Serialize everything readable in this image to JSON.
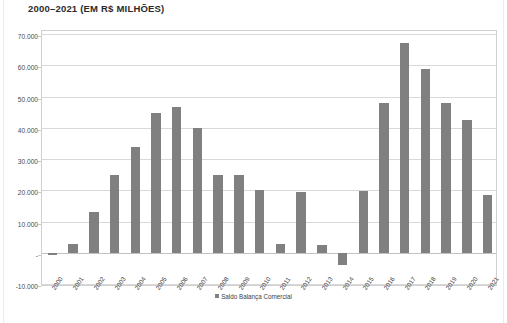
{
  "chart_data": {
    "type": "bar",
    "title": "2000–2021 (EM R$ MILHÕES)",
    "xlabel": "",
    "ylabel": "",
    "ylim": [
      -10000,
      70000
    ],
    "ytick_step": 10000,
    "ytick_labels": [
      "70.000",
      "60.000",
      "50.000",
      "40.000",
      "30.000",
      "20.000",
      "10.000",
      "-",
      "-10.000"
    ],
    "ytick_values": [
      70000,
      60000,
      50000,
      40000,
      30000,
      20000,
      10000,
      0,
      -10000
    ],
    "grid": true,
    "legend_position": "bottom",
    "bar_color": "#808080",
    "categories": [
      "2000",
      "2001",
      "2002",
      "2003",
      "2004",
      "2005",
      "2006",
      "2007",
      "2008",
      "2009",
      "2010",
      "2011",
      "2012",
      "2013",
      "2014",
      "2015",
      "2016",
      "2017",
      "2018",
      "2019",
      "2020",
      "2021"
    ],
    "series": [
      {
        "name": "Saldo Balança Comercial",
        "values": [
          -700,
          2700,
          13200,
          24900,
          33900,
          44700,
          46500,
          40000,
          24800,
          25000,
          20200,
          2900,
          19400,
          2400,
          -4000,
          19700,
          47800,
          67000,
          58700,
          48000,
          42400,
          18500
        ]
      }
    ]
  },
  "legend": {
    "entries": [
      {
        "label": "Saldo Balança Comercial",
        "color": "#808080"
      }
    ]
  }
}
